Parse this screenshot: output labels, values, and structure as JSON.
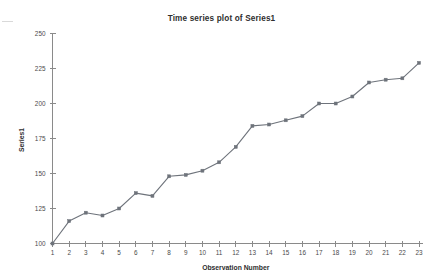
{
  "chart_data": {
    "type": "line",
    "title": "Time series plot of Series1",
    "xlabel": "Observation Number",
    "ylabel": "Series1",
    "x": [
      1,
      2,
      3,
      4,
      5,
      6,
      7,
      8,
      9,
      10,
      11,
      12,
      13,
      14,
      15,
      16,
      17,
      18,
      19,
      20,
      21,
      22,
      23
    ],
    "values": [
      100,
      116,
      122,
      120,
      125,
      136,
      134,
      148,
      149,
      152,
      158,
      169,
      184,
      185,
      188,
      191,
      200,
      200,
      205,
      215,
      217,
      218,
      229
    ],
    "series": [
      {
        "name": "Series1",
        "values": [
          100,
          116,
          122,
          120,
          125,
          136,
          134,
          148,
          149,
          152,
          158,
          169,
          184,
          185,
          188,
          191,
          200,
          200,
          205,
          215,
          217,
          218,
          229
        ]
      }
    ],
    "xlim": [
      1,
      23
    ],
    "ylim": [
      100,
      250
    ],
    "ytick_labels": [
      "100",
      "125",
      "150",
      "175",
      "200",
      "225",
      "250"
    ],
    "yticks": [
      100,
      125,
      150,
      175,
      200,
      225,
      250
    ],
    "xtick_labels": [
      "1",
      "2",
      "3",
      "4",
      "5",
      "6",
      "7",
      "8",
      "9",
      "10",
      "11",
      "12",
      "13",
      "14",
      "15",
      "16",
      "17",
      "18",
      "19",
      "20",
      "21",
      "22",
      "23"
    ],
    "grid": false,
    "legend": false,
    "marker": "square",
    "line_color": "#6e737b",
    "marker_color": "#6e737b",
    "axis_color": "#8a8a8a",
    "background": "#ffffff"
  }
}
